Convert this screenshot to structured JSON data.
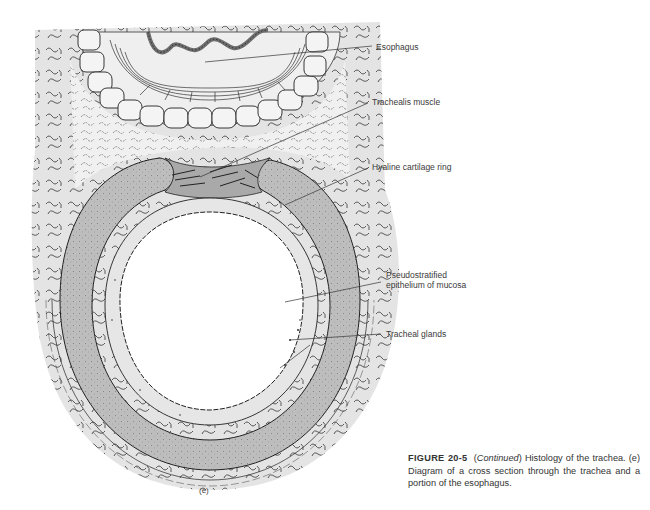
{
  "diagram": {
    "subject": "Cross section through the trachea and a portion of the esophagus",
    "panel_label": "(e)",
    "labels": [
      {
        "id": "esophagus",
        "text": "Esophagus"
      },
      {
        "id": "trachealis",
        "text": "Trachealis muscle"
      },
      {
        "id": "hyaline",
        "text": "Hyaline cartilage ring"
      },
      {
        "id": "epithelium",
        "text": "Pseudostratified epithelium of mucosa"
      },
      {
        "id": "glands",
        "text": "Tracheal glands"
      }
    ],
    "colors": {
      "connective_tissue": "#e2e2e2",
      "cartilage": "#bdbdbd",
      "muscle": "#a9a9a9",
      "esophagus_mucosa": "#8a8a8a",
      "outline": "#222222"
    }
  },
  "caption": {
    "figure_number": "FIGURE 20-5",
    "continued": "Continued",
    "text": ") Histology of the trachea. (e) Diagram of a cross section through the trachea and a portion of the esophagus."
  }
}
